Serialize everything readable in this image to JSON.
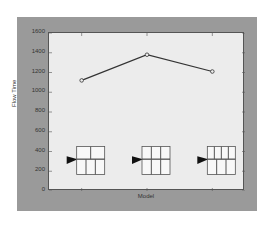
{
  "chart_data": {
    "type": "line",
    "title": "",
    "xlabel": "Model",
    "ylabel": "Flow Time",
    "categories": [
      "Layout 1",
      "Layout 2",
      "Layout 3"
    ],
    "x": [
      1,
      2,
      3
    ],
    "values": [
      1120,
      1380,
      1210
    ],
    "ylim": [
      0,
      1600
    ],
    "yticks": [
      0,
      200,
      400,
      600,
      800,
      1000,
      1200,
      1400,
      1600
    ],
    "xticks": [
      1,
      2,
      3
    ],
    "grid": false,
    "legend": null,
    "marker": "circle",
    "annotations": [
      {
        "x": 1,
        "type": "layout-diagram",
        "description": "arrow into 2-cell top row / 3-cell bottom row grid"
      },
      {
        "x": 2,
        "type": "layout-diagram",
        "description": "arrow into 3-cell top row / 3-cell bottom row grid"
      },
      {
        "x": 3,
        "type": "layout-diagram",
        "description": "arrow into 4-cell top row / 3-cell bottom row grid"
      }
    ]
  },
  "axes": {
    "xlabel": "Model",
    "ylabel": "Flow Time",
    "ytick_labels": [
      "0",
      "200",
      "400",
      "600",
      "800",
      "1000",
      "1200",
      "1400",
      "1600"
    ]
  },
  "colors": {
    "figure_bg": "#9a9a9a",
    "plot_bg": "#ececec",
    "line": "#333333"
  }
}
